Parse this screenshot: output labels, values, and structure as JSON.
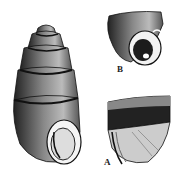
{
  "figure": {
    "specimens": [
      {
        "id": "main",
        "label": "",
        "view": "full shell, apertural view"
      },
      {
        "id": "B",
        "label": "B",
        "view": "body whorl, aperture detail"
      },
      {
        "id": "A",
        "label": "A",
        "view": "body whorl, lateral view"
      }
    ],
    "colors": {
      "ink": "#1a1a1a",
      "paper": "#ffffff",
      "shade": "#555555"
    }
  }
}
